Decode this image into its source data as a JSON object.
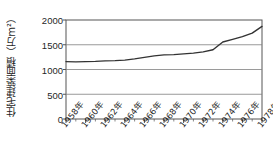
{
  "chart_data": {
    "type": "line",
    "title": "",
    "xlabel": "",
    "ylabel": "住宅建築面積（万m²）",
    "ylim": [
      0,
      2000
    ],
    "yticks": [
      0,
      500,
      1000,
      1500,
      2000
    ],
    "ytick_labels": [
      "0",
      "500",
      "1000",
      "1500",
      "2000"
    ],
    "grid": true,
    "legend": false,
    "x": [
      1958,
      1959,
      1960,
      1961,
      1962,
      1963,
      1964,
      1965,
      1966,
      1967,
      1968,
      1969,
      1970,
      1971,
      1972,
      1973,
      1974,
      1975,
      1976,
      1977,
      1978
    ],
    "xtick_labels": [
      "1958年",
      "1960年",
      "1962年",
      "1964年",
      "1966年",
      "1968年",
      "1970年",
      "1972年",
      "1974年",
      "1976年",
      "1978年"
    ],
    "xticks": [
      1958,
      1960,
      1962,
      1964,
      1966,
      1968,
      1970,
      1972,
      1974,
      1976,
      1978
    ],
    "values": [
      1160,
      1155,
      1160,
      1165,
      1175,
      1180,
      1190,
      1215,
      1245,
      1275,
      1295,
      1300,
      1315,
      1330,
      1355,
      1400,
      1555,
      1610,
      1665,
      1735,
      1870
    ],
    "series_color": "#333333",
    "grid_color": "#808080",
    "axis_color": "#555555",
    "background": "#ffffff"
  }
}
